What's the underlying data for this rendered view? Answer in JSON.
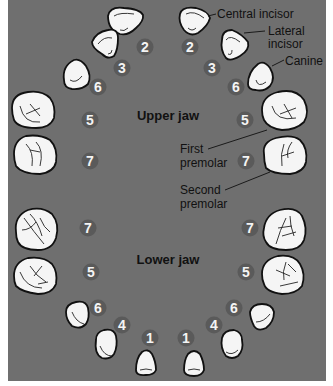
{
  "colors": {
    "background": "#6f6f6f",
    "tooth_fill": "#f5f5f5",
    "tooth_outline": "#111111",
    "badge_fill": "#5a5a5a",
    "badge_text": "#f4f4f4",
    "label_text": "#111111"
  },
  "jaws": {
    "upper": {
      "title": "Upper jaw"
    },
    "lower": {
      "title": "Lower jaw"
    }
  },
  "labels": {
    "central_incisor": "Central incisor",
    "lateral_incisor_line1": "Lateral",
    "lateral_incisor_line2": "incisor",
    "canine": "Canine",
    "first_premolar_line1": "First",
    "first_premolar_line2": "premolar",
    "second_premolar_line1": "Second",
    "second_premolar_line2": "premolar"
  },
  "eruption_order": {
    "upper": {
      "left": {
        "central_incisor": "2",
        "lateral_incisor": "3",
        "canine": "6",
        "first_premolar": "5",
        "second_premolar": "7"
      },
      "right": {
        "central_incisor": "2",
        "lateral_incisor": "3",
        "canine": "6",
        "first_premolar": "5",
        "second_premolar": "7"
      }
    },
    "lower": {
      "left": {
        "second_premolar": "7",
        "first_premolar": "5",
        "canine": "6",
        "lateral_incisor": "4",
        "central_incisor": "1"
      },
      "right": {
        "second_premolar": "7",
        "first_premolar": "5",
        "canine": "6",
        "lateral_incisor": "4",
        "central_incisor": "1"
      }
    }
  }
}
